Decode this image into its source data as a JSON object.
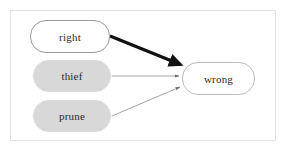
{
  "diagram": {
    "background_color": "#ffffff",
    "frame": {
      "name": "outer-frame",
      "border_color": "#e3e3e3"
    },
    "nodes": [
      {
        "id": "right",
        "label": "right",
        "shape": "rounded-rectangle",
        "fill": "#ffffff",
        "stroke": "#9a9a9a",
        "text_color": "#2b2b2b"
      },
      {
        "id": "thief",
        "label": "thief",
        "shape": "rounded-rectangle",
        "fill": "#d8d8d8",
        "stroke": "#d8d8d8",
        "text_color": "#2b2b2b"
      },
      {
        "id": "prune",
        "label": "prune",
        "shape": "rounded-rectangle",
        "fill": "#d8d8d8",
        "stroke": "#d8d8d8",
        "text_color": "#2b2b2b"
      },
      {
        "id": "wrong",
        "label": "wrong",
        "shape": "rounded-rectangle",
        "fill": "#ffffff",
        "stroke": "#bcbcbc",
        "text_color": "#2b2b2b"
      }
    ],
    "edges": [
      {
        "id": "right-to-wrong",
        "from": "right",
        "to": "wrong",
        "style": "thick-arrow",
        "color": "#111111",
        "width": 3.2
      },
      {
        "id": "thief-to-wrong",
        "from": "thief",
        "to": "wrong",
        "style": "thin-arrow",
        "color": "#8d8d8d",
        "width": 0.8
      },
      {
        "id": "prune-to-wrong",
        "from": "prune",
        "to": "wrong",
        "style": "thin-arrow",
        "color": "#8d8d8d",
        "width": 0.8
      }
    ]
  }
}
